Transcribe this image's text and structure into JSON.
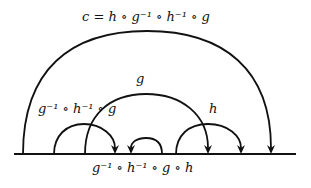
{
  "diagram": {
    "type": "arc-composition-diagram",
    "baseline": {
      "x1": 14,
      "x2": 296,
      "y": 154
    },
    "stroke_color": "#111111",
    "arcs": [
      {
        "id": "c",
        "from_x": 23,
        "to_x": 271,
        "peak_y": 31,
        "arrow_at": "right",
        "label": "c = h ∘ g⁻¹ ∘ h⁻¹ ∘ g"
      },
      {
        "id": "g",
        "from_x": 85,
        "to_x": 208,
        "peak_y": 94,
        "arrow_at": "right",
        "label": "g"
      },
      {
        "id": "conj",
        "from_x": 54,
        "to_x": 115,
        "peak_y": 124,
        "arrow_at": "right",
        "label": "g⁻¹ ∘ h⁻¹ ∘ g"
      },
      {
        "id": "small",
        "from_x": 131,
        "to_x": 162,
        "peak_y": 138,
        "arrow_at": "left",
        "label": ""
      },
      {
        "id": "h",
        "from_x": 176,
        "to_x": 241,
        "peak_y": 124,
        "arrow_at": "right",
        "label": "h"
      }
    ],
    "labels": {
      "top": "c = h ∘ g⁻¹ ∘ h⁻¹ ∘ g",
      "g": "g",
      "left": "g⁻¹ ∘ h⁻¹ ∘ g",
      "h": "h",
      "bottom": "g⁻¹ ∘ h⁻¹ ∘ g ∘ h"
    }
  }
}
